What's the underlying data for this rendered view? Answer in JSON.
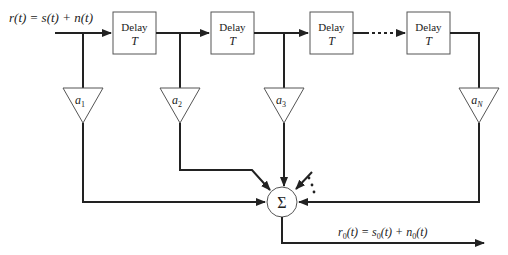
{
  "diagram": {
    "input_label": "r(t) = s(t) + n(t)",
    "output_label": "r0(t) = s0(t) + n0(t)",
    "delay_blocks": [
      {
        "line1": "Delay",
        "line2": "T"
      },
      {
        "line1": "Delay",
        "line2": "T"
      },
      {
        "line1": "Delay",
        "line2": "T"
      },
      {
        "line1": "Delay",
        "line2": "T"
      }
    ],
    "gains": [
      {
        "base": "a",
        "sub": "1"
      },
      {
        "base": "a",
        "sub": "2"
      },
      {
        "base": "a",
        "sub": "3"
      },
      {
        "base": "a",
        "sub": "N"
      }
    ],
    "summer_symbol": "Σ",
    "ellipsis": "⋯",
    "colors": {
      "line": "#222222",
      "box": "#555555",
      "background": "#ffffff"
    }
  }
}
